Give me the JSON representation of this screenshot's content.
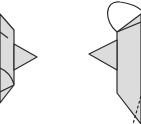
{
  "diagram": {
    "type": "origami-fold-steps",
    "colors": {
      "paper": "#dcdcdc",
      "line": "#2a2a2a",
      "background": "#ffffff"
    },
    "figures": [
      {
        "name": "left-figure",
        "description": "partially visible folded model with triangular flap pointing right"
      },
      {
        "name": "right-figure",
        "description": "partially visible folded model with triangular flap pointing left, curved loop on top, dashed fold line"
      }
    ]
  }
}
